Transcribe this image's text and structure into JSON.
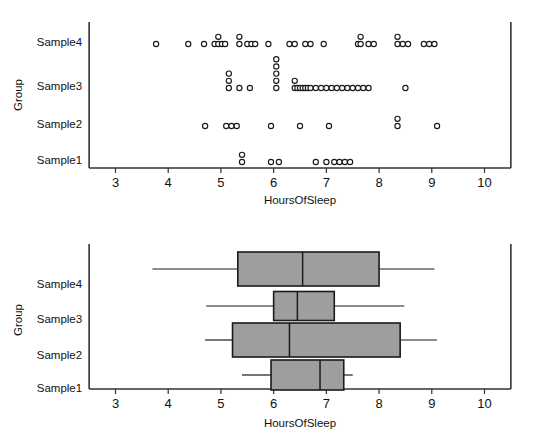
{
  "chart_data": [
    {
      "type": "scatter",
      "name": "dotplot",
      "title": "",
      "xlabel": "HoursOfSleep",
      "ylabel": "Group",
      "xlim": [
        2.5,
        10.5
      ],
      "xticks": [
        3,
        4,
        5,
        6,
        7,
        8,
        9,
        10
      ],
      "xticklabels": [
        "3",
        "4",
        "5",
        "6",
        "7",
        "8",
        "9",
        "10"
      ],
      "categories": [
        "Sample1",
        "Sample2",
        "Sample3",
        "Sample4"
      ],
      "grid": false,
      "legend": false,
      "series": [
        {
          "name": "Sample4",
          "values": [
            3.77,
            4.38,
            4.68,
            4.88,
            4.95,
            4.95,
            5.02,
            5.08,
            5.35,
            5.35,
            5.5,
            5.58,
            5.65,
            5.9,
            6.3,
            6.4,
            6.6,
            6.7,
            6.95,
            7.6,
            7.65,
            7.65,
            7.8,
            7.9,
            8.35,
            8.35,
            8.45,
            8.55,
            8.85,
            8.95,
            9.05
          ]
        },
        {
          "name": "Sample3",
          "values": [
            5.15,
            5.15,
            5.15,
            5.35,
            5.55,
            6.05,
            6.05,
            6.05,
            6.05,
            6.05,
            6.4,
            6.4,
            6.45,
            6.5,
            6.55,
            6.6,
            6.65,
            6.7,
            6.8,
            6.9,
            7.0,
            7.1,
            7.2,
            7.3,
            7.4,
            7.5,
            7.6,
            7.7,
            7.8,
            8.5
          ]
        },
        {
          "name": "Sample2",
          "values": [
            4.7,
            5.1,
            5.2,
            5.3,
            5.95,
            6.5,
            7.05,
            8.35,
            8.35,
            9.1
          ]
        },
        {
          "name": "Sample1",
          "values": [
            5.4,
            5.4,
            5.95,
            6.1,
            6.8,
            7.0,
            7.15,
            7.25,
            7.35,
            7.45
          ]
        }
      ]
    },
    {
      "type": "boxplot",
      "name": "boxplot",
      "title": "",
      "xlabel": "HoursOfSleep",
      "ylabel": "Group",
      "xlim": [
        2.5,
        10.5
      ],
      "xticks": [
        3,
        4,
        5,
        6,
        7,
        8,
        9,
        10
      ],
      "xticklabels": [
        "3",
        "4",
        "5",
        "6",
        "7",
        "8",
        "9",
        "10"
      ],
      "categories": [
        "Sample1",
        "Sample2",
        "Sample3",
        "Sample4"
      ],
      "grid": false,
      "legend": false,
      "boxes": [
        {
          "name": "Sample4",
          "whisker_low": 3.7,
          "q1": 5.32,
          "median": 6.55,
          "q3": 8.0,
          "whisker_high": 9.05
        },
        {
          "name": "Sample3",
          "whisker_low": 4.72,
          "q1": 6.0,
          "median": 6.45,
          "q3": 7.15,
          "whisker_high": 8.48
        },
        {
          "name": "Sample2",
          "whisker_low": 4.7,
          "q1": 5.22,
          "median": 6.3,
          "q3": 8.4,
          "whisker_high": 9.1
        },
        {
          "name": "Sample1",
          "whisker_low": 5.4,
          "q1": 5.95,
          "median": 6.88,
          "q3": 7.33,
          "whisker_high": 7.5
        }
      ]
    }
  ],
  "style": {
    "box_fill": "#9e9e9e",
    "box_stroke": "#1b1b1b",
    "dot_fill": "#ffffff",
    "dot_stroke": "#1b1b1b",
    "axis_color": "#333333",
    "text_color": "#111111",
    "background": "#ffffff"
  }
}
